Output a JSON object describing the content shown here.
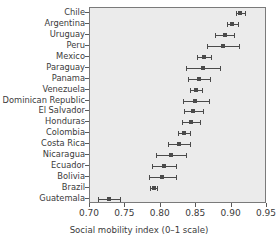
{
  "chart_data": {
    "type": "scatter",
    "title": "",
    "xlabel": "Social mobility index (0–1 scale)",
    "ylabel": "",
    "xlim": [
      0.7,
      0.95
    ],
    "xticks": [
      0.7,
      0.75,
      0.8,
      0.85,
      0.9,
      0.95
    ],
    "xtick_labels": [
      "0.70",
      "0.75",
      "0.80",
      "0.85",
      "0.90",
      "0.95"
    ],
    "grid": false,
    "legend": null,
    "error_bars": "horizontal confidence intervals",
    "categories": [
      "Chile",
      "Argentina",
      "Uruguay",
      "Peru",
      "Mexico",
      "Paraguay",
      "Panama",
      "Venezuela",
      "Dominican Republic",
      "El Salvador",
      "Honduras",
      "Colombia",
      "Costa Rica",
      "Nicaragua",
      "Ecuador",
      "Bolivia",
      "Brazil",
      "Guatemala"
    ],
    "points": [
      {
        "category": "Chile",
        "value": 0.912,
        "low": 0.906,
        "high": 0.919
      },
      {
        "category": "Argentina",
        "value": 0.901,
        "low": 0.893,
        "high": 0.909
      },
      {
        "category": "Uruguay",
        "value": 0.89,
        "low": 0.876,
        "high": 0.904
      },
      {
        "category": "Peru",
        "value": 0.888,
        "low": 0.865,
        "high": 0.91
      },
      {
        "category": "Mexico",
        "value": 0.861,
        "low": 0.851,
        "high": 0.871
      },
      {
        "category": "Paraguay",
        "value": 0.859,
        "low": 0.835,
        "high": 0.883
      },
      {
        "category": "Panama",
        "value": 0.854,
        "low": 0.839,
        "high": 0.869
      },
      {
        "category": "Venezuela",
        "value": 0.85,
        "low": 0.841,
        "high": 0.858
      },
      {
        "category": "Dominican Republic",
        "value": 0.849,
        "low": 0.831,
        "high": 0.868
      },
      {
        "category": "El Salvador",
        "value": 0.846,
        "low": 0.833,
        "high": 0.86
      },
      {
        "category": "Honduras",
        "value": 0.842,
        "low": 0.83,
        "high": 0.855
      },
      {
        "category": "Colombia",
        "value": 0.833,
        "low": 0.824,
        "high": 0.841
      },
      {
        "category": "Costa Rica",
        "value": 0.826,
        "low": 0.81,
        "high": 0.841
      },
      {
        "category": "Nicaragua",
        "value": 0.814,
        "low": 0.793,
        "high": 0.835
      },
      {
        "category": "Ecuador",
        "value": 0.805,
        "low": 0.788,
        "high": 0.821
      },
      {
        "category": "Bolivia",
        "value": 0.801,
        "low": 0.783,
        "high": 0.821
      },
      {
        "category": "Brazil",
        "value": 0.79,
        "low": 0.785,
        "high": 0.795
      },
      {
        "category": "Guatemala",
        "value": 0.727,
        "low": 0.712,
        "high": 0.743
      }
    ]
  }
}
